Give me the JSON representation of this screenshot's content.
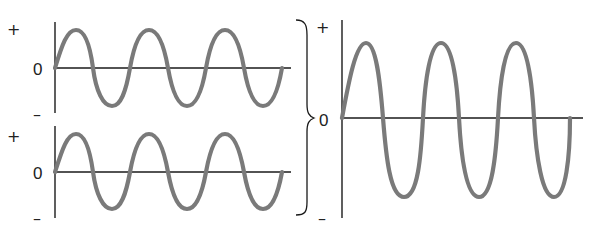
{
  "figure": {
    "colors": {
      "wave": "#7a7a7a",
      "axis": "#1a1a1a",
      "background": "#ffffff"
    }
  },
  "panels": [
    {
      "id": "wave-1",
      "labels": {
        "plus": "+",
        "zero": "0",
        "minus": "–"
      },
      "cycles": 3,
      "amplitude": "small"
    },
    {
      "id": "wave-2",
      "labels": {
        "plus": "+",
        "zero": "0",
        "minus": "–"
      },
      "cycles": 3,
      "amplitude": "small"
    },
    {
      "id": "sum-wave",
      "labels": {
        "plus": "+",
        "zero": "0",
        "minus": "–"
      },
      "cycles": 3,
      "amplitude": "large"
    }
  ],
  "connector": {
    "type": "right-curly-brace",
    "meaning": "sum of the two left waves"
  }
}
